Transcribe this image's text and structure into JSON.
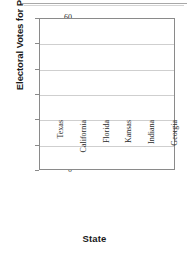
{
  "chart_data": {
    "type": "bar",
    "title": "",
    "subtitle": "",
    "xlabel": "State",
    "ylabel": "Electoral Votes for President",
    "categories": [
      "Texas",
      "California",
      "Florida",
      "Kansas",
      "Indiana",
      "Georgia"
    ],
    "values": [
      null,
      null,
      null,
      null,
      null,
      null
    ],
    "series": [
      {
        "name": "Electoral Votes for President",
        "values": [
          null,
          null,
          null,
          null,
          null,
          null
        ]
      }
    ],
    "ylim": [
      0,
      60
    ],
    "ytick_labels": [
      "0",
      "10",
      "20",
      "30",
      "40",
      "50",
      "60"
    ],
    "ytick_values": [
      0,
      10,
      20,
      30,
      40,
      50,
      60
    ],
    "ytick_step": 10,
    "grid": true,
    "gridline_values": [
      10,
      20,
      30,
      40,
      50
    ],
    "legend": false,
    "legend_position": "none",
    "annotations": [],
    "note": "Empty plot area - no bars plotted; blank template grid",
    "colors": {
      "axis": "#8a8a8a",
      "gridline": "#cfcfcf",
      "text": "#1a1a1a",
      "tick_text": "#2b2b2b",
      "background": "#ffffff"
    }
  }
}
